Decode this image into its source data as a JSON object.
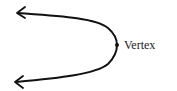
{
  "diagram": {
    "type": "parabola-opening-left",
    "labels": {
      "vertex": "Vertex"
    },
    "colors": {
      "stroke": "#111111",
      "text": "#222222",
      "background": "#ffffff"
    }
  }
}
